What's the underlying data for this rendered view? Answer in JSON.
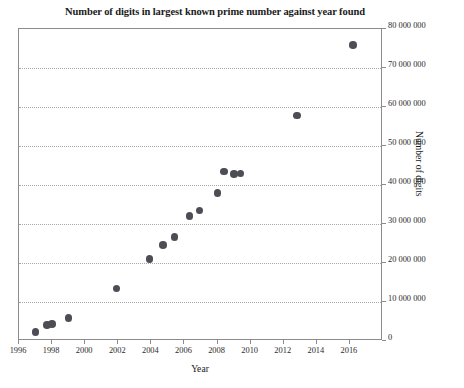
{
  "chart_data": {
    "type": "scatter",
    "title": "Number of digits in largest known prime number against year found",
    "xlabel": "Year",
    "ylabel": "Number of digits",
    "xlim": [
      1996,
      2018
    ],
    "ylim": [
      0,
      80000000
    ],
    "grid": true,
    "legend": false,
    "marker_color": "#4d4d55",
    "xticks": [
      1996,
      1998,
      2000,
      2002,
      2004,
      2006,
      2008,
      2010,
      2012,
      2014,
      2016
    ],
    "xtick_labels": [
      "1996",
      "1998",
      "2000",
      "2002",
      "2004",
      "2006",
      "2008",
      "2010",
      "2012",
      "2014",
      "2016"
    ],
    "yticks": [
      0,
      10000000,
      20000000,
      30000000,
      40000000,
      50000000,
      60000000,
      70000000,
      80000000
    ],
    "ytick_labels": [
      "0",
      "10 000 000",
      "20 000 000",
      "30 000 000",
      "40 000 000",
      "50 000 000",
      "60 000 000",
      "70 000 000",
      "80 000 000"
    ],
    "x": [
      1997.0,
      1997.7,
      1998.0,
      1999.0,
      2001.9,
      2003.9,
      2004.7,
      2005.4,
      2006.3,
      2006.9,
      2008.0,
      2008.4,
      2009.4,
      2009.0,
      2012.8,
      2016.2
    ],
    "y": [
      2300000,
      4100000,
      4400000,
      5900000,
      13400000,
      21000000,
      24600000,
      26700000,
      32000000,
      33400000,
      38000000,
      43400000,
      43000000,
      42800000,
      57800000,
      75900000
    ],
    "points": [
      {
        "x": 1997.0,
        "y": 2300000
      },
      {
        "x": 1997.7,
        "y": 4100000
      },
      {
        "x": 1998.0,
        "y": 4400000
      },
      {
        "x": 1999.0,
        "y": 5900000
      },
      {
        "x": 2001.9,
        "y": 13400000
      },
      {
        "x": 2003.9,
        "y": 21000000
      },
      {
        "x": 2004.7,
        "y": 24600000
      },
      {
        "x": 2005.4,
        "y": 26700000
      },
      {
        "x": 2006.3,
        "y": 32000000
      },
      {
        "x": 2006.9,
        "y": 33400000
      },
      {
        "x": 2008.0,
        "y": 38000000
      },
      {
        "x": 2008.4,
        "y": 43400000
      },
      {
        "x": 2009.4,
        "y": 43000000
      },
      {
        "x": 2009.0,
        "y": 42800000
      },
      {
        "x": 2012.8,
        "y": 57800000
      },
      {
        "x": 2016.2,
        "y": 75900000
      }
    ]
  }
}
